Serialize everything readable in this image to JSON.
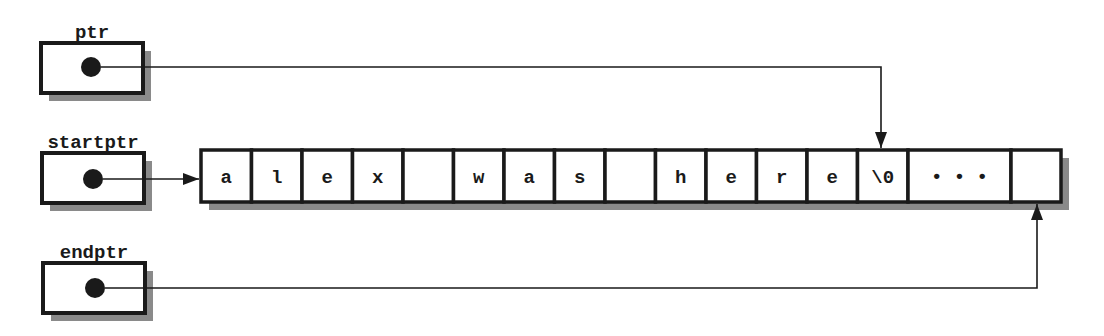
{
  "diagram": {
    "pointers": [
      {
        "id": "ptr",
        "label": "ptr",
        "box": {
          "x": 41,
          "y": 43,
          "w": 102,
          "h": 50
        },
        "dot": {
          "cx": 91,
          "cy": 67,
          "r": 10
        },
        "target": "cell-13-top"
      },
      {
        "id": "startptr",
        "label": "startptr",
        "box": {
          "x": 42,
          "y": 153,
          "w": 102,
          "h": 50
        },
        "dot": {
          "cx": 93,
          "cy": 179,
          "r": 10
        },
        "target": "cell-0-left"
      },
      {
        "id": "endptr",
        "label": "endptr",
        "box": {
          "x": 43,
          "y": 263,
          "w": 102,
          "h": 50
        },
        "dot": {
          "cx": 95,
          "cy": 288,
          "r": 10
        },
        "target": "cell-last-bottom"
      }
    ],
    "array": {
      "x": 201,
      "y": 150,
      "h": 52,
      "cells": [
        {
          "text": "a",
          "w": 50.5
        },
        {
          "text": "l",
          "w": 50.5
        },
        {
          "text": "e",
          "w": 50.5
        },
        {
          "text": "x",
          "w": 50.5
        },
        {
          "text": "",
          "w": 50.5
        },
        {
          "text": "w",
          "w": 50.5
        },
        {
          "text": "a",
          "w": 50.5
        },
        {
          "text": "s",
          "w": 50.5
        },
        {
          "text": "",
          "w": 50.5
        },
        {
          "text": "h",
          "w": 50.5
        },
        {
          "text": "e",
          "w": 50.5
        },
        {
          "text": "r",
          "w": 50.5
        },
        {
          "text": "e",
          "w": 50.5
        },
        {
          "text": "\\0",
          "w": 50.5
        },
        {
          "text": "• • •",
          "w": 103
        },
        {
          "text": "",
          "w": 50
        }
      ]
    },
    "connectors": {
      "ptr": {
        "points": [
          [
            101,
            67
          ],
          [
            881,
            67
          ],
          [
            881,
            148
          ]
        ],
        "arrow": "down"
      },
      "startptr": {
        "points": [
          [
            103,
            179
          ],
          [
            199,
            179
          ]
        ],
        "arrow": "right"
      },
      "endptr": {
        "points": [
          [
            105,
            288
          ],
          [
            1037,
            288
          ],
          [
            1037,
            204
          ]
        ],
        "arrow": "up"
      }
    },
    "colors": {
      "ink": "#1a1a1a",
      "shadow": "#8a8a8a",
      "background": "#ffffff"
    }
  }
}
